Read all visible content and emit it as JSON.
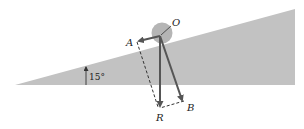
{
  "diagram": {
    "title": "",
    "incline": {
      "angle_label": "15°",
      "color": "#c2c2c2"
    },
    "body": {
      "shape": "sphere",
      "color": "#b5b5b5"
    },
    "points": {
      "O": "O",
      "A": "A",
      "B": "B",
      "R": "R"
    },
    "vectors": [
      {
        "from": "O",
        "to": "A",
        "style": "solid-arrow"
      },
      {
        "from": "O",
        "to": "B",
        "style": "solid-arrow"
      },
      {
        "from": "O",
        "to": "R",
        "style": "solid-arrow"
      },
      {
        "from": "A",
        "to": "R",
        "style": "dashed"
      },
      {
        "from": "B",
        "to": "R",
        "style": "dashed"
      }
    ],
    "colors": {
      "vector": "#555555",
      "text": "#222222"
    }
  }
}
